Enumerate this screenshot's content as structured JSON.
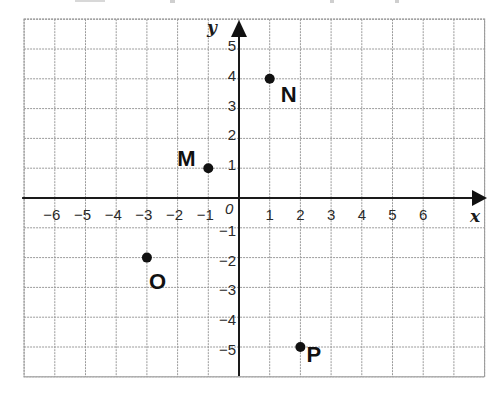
{
  "chart_data": {
    "type": "scatter",
    "title": "",
    "xlabel": "x",
    "ylabel": "y",
    "origin_label": "0",
    "xlim": [
      -7,
      8
    ],
    "ylim": [
      -6,
      6
    ],
    "grid": true,
    "x_ticks": [
      -6,
      -5,
      -4,
      -3,
      -2,
      -1,
      1,
      2,
      3,
      4,
      5,
      6
    ],
    "y_ticks": [
      5,
      4,
      3,
      2,
      1,
      -1,
      -2,
      -3,
      -4,
      -5
    ],
    "x_tick_labels": [
      "−6",
      "−5",
      "−4",
      "−3",
      "−2",
      "−1",
      "1",
      "2",
      "3",
      "4",
      "5",
      "6"
    ],
    "y_tick_labels": [
      "5",
      "4",
      "3",
      "2",
      "1",
      "−1",
      "−2",
      "−3",
      "−4",
      "−5"
    ],
    "points": [
      {
        "name": "M",
        "x": -1,
        "y": 1
      },
      {
        "name": "N",
        "x": 1,
        "y": 4
      },
      {
        "name": "O",
        "x": -3,
        "y": -2
      },
      {
        "name": "P",
        "x": 2,
        "y": -5
      }
    ],
    "legend": null
  },
  "colors": {
    "grid": "#9a9a9a",
    "axis": "#1a1a1a",
    "point": "#111111",
    "background": "#ffffff"
  }
}
